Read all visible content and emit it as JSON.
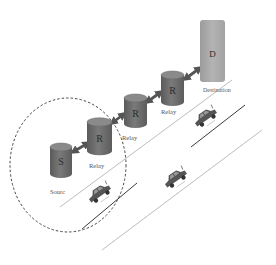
{
  "diagram": {
    "type": "vehicular multi-hop relay network",
    "nodes": [
      {
        "id": "S",
        "letter": "S",
        "label": "Sourc",
        "shape": "cylinder"
      },
      {
        "id": "R1",
        "letter": "R",
        "label": "Relay",
        "shape": "cylinder"
      },
      {
        "id": "R2",
        "letter": "R",
        "label": "Relay",
        "shape": "cylinder"
      },
      {
        "id": "R3",
        "letter": "R",
        "label": "Relay",
        "shape": "cylinder"
      },
      {
        "id": "D",
        "letter": "D",
        "label": "Destination",
        "shape": "rounded-rectangle"
      }
    ],
    "links": [
      {
        "from": "S",
        "to": "R1",
        "type": "bidirectional-arrow"
      },
      {
        "from": "R1",
        "to": "R2",
        "type": "bidirectional-arrow"
      },
      {
        "from": "R2",
        "to": "R3",
        "type": "bidirectional-arrow"
      },
      {
        "from": "R3",
        "to": "D",
        "type": "bidirectional-arrow"
      }
    ],
    "coverage_area": {
      "style": "dashed-ellipse",
      "encloses": [
        "S",
        "R1"
      ]
    },
    "vehicles": [
      {
        "id": "car-1",
        "lane": "left"
      },
      {
        "id": "car-2",
        "lane": "right"
      },
      {
        "id": "car-3",
        "lane": "left"
      }
    ],
    "road": {
      "lines": [
        "upper-edge",
        "center-lane-marking",
        "lower-edge"
      ]
    },
    "colors": {
      "cylinder_body": "#6e6e6e",
      "cylinder_top": "#8a8a8a",
      "destination_fill": "#a9a9a9",
      "arrow": "#555555",
      "road_edge": "#bdbdbd",
      "lane_marking": "#3a3a3a",
      "coverage_dash": "#333333"
    }
  }
}
